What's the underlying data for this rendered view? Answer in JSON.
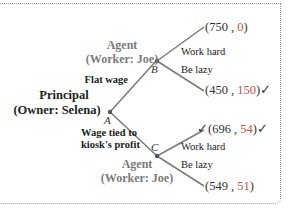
{
  "diagram": {
    "type": "game-tree",
    "principal": {
      "label_line1": "Principal",
      "label_line2": "(Owner: Selena)",
      "node": "A"
    },
    "branches_from_A": [
      {
        "label": "Flat wage",
        "to": "B"
      },
      {
        "label_line1": "Wage tied to",
        "label_line2": "kiosk's profit",
        "to": "C"
      }
    ],
    "agent_B": {
      "label_line1": "Agent",
      "label_line2": "(Worker: Joe)",
      "node": "B",
      "branches": [
        {
          "label": "Work hard",
          "payoff_owner": "750",
          "payoff_worker": "0",
          "payoff_text_open": "(750 , ",
          "payoff_text_close": ")",
          "check_before": "",
          "check_after": ""
        },
        {
          "label": "Be lazy",
          "payoff_owner": "450",
          "payoff_worker": "150",
          "payoff_text_open": "(450 , ",
          "payoff_text_close": ")",
          "check_before": "",
          "check_after": "✓"
        }
      ]
    },
    "agent_C": {
      "label_line1": "Agent",
      "label_line2": "(Worker: Joe)",
      "node": "C",
      "branches": [
        {
          "label": "Work hard",
          "payoff_owner": "696",
          "payoff_worker": "54",
          "payoff_text_open": "(696 , ",
          "payoff_text_close": ")",
          "check_before": "✓",
          "check_after": "✓"
        },
        {
          "label": "Be lazy",
          "payoff_owner": "549",
          "payoff_worker": "51",
          "payoff_text_open": "(549 , ",
          "payoff_text_close": ")",
          "check_before": "",
          "check_after": ""
        }
      ]
    },
    "colors": {
      "line": "#7a7a7a",
      "agent_label": "#7a7a7a",
      "worker_payoff": "#c0504d",
      "text": "#222222",
      "frame": "#9a9a9a"
    }
  }
}
